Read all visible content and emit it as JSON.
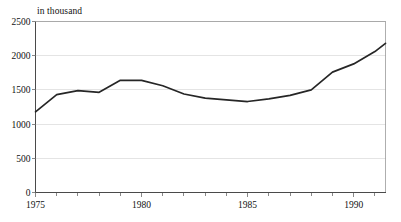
{
  "chart_data": {
    "type": "line",
    "title": "",
    "subtitle": "",
    "unit_label": "in thousand",
    "xlabel": "",
    "ylabel": "",
    "xlim": [
      1975,
      1991.5
    ],
    "ylim": [
      0,
      2500
    ],
    "grid": true,
    "grid_axis": "y",
    "legend": "none",
    "x_tick_labels": [
      "1975",
      "1980",
      "1985",
      "1990"
    ],
    "x_major_ticks": [
      1975,
      1980,
      1985,
      1990
    ],
    "x_minor_ticks": [
      1976,
      1977,
      1978,
      1979,
      1981,
      1982,
      1983,
      1984,
      1986,
      1987,
      1988,
      1989,
      1991
    ],
    "y_tick_labels": [
      "0",
      "500",
      "1000",
      "1500",
      "2000",
      "2500"
    ],
    "y_ticks": [
      0,
      500,
      1000,
      1500,
      2000,
      2500
    ],
    "series": [
      {
        "name": "value",
        "color": "#262626",
        "x": [
          1975,
          1976,
          1977,
          1978,
          1979,
          1980,
          1981,
          1982,
          1983,
          1984,
          1985,
          1986,
          1987,
          1988,
          1989,
          1990,
          1991,
          1991.5
        ],
        "values": [
          1180,
          1430,
          1490,
          1465,
          1640,
          1640,
          1560,
          1440,
          1380,
          1355,
          1330,
          1370,
          1420,
          1500,
          1760,
          1880,
          2060,
          2180
        ]
      }
    ]
  },
  "colors": {
    "line": "#262626",
    "grid": "#d9d9d9",
    "axis": "#4a4a4a",
    "frame": "#9a9a9a",
    "text": "#111111",
    "background": "#ffffff"
  }
}
